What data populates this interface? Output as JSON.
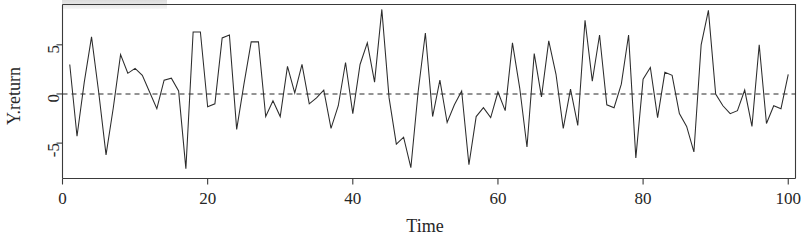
{
  "chart_data": {
    "type": "line",
    "title": "",
    "subtitle": "",
    "xlabel": "Time",
    "ylabel": "Y.return",
    "xlim": [
      0,
      101
    ],
    "ylim": [
      -8.6,
      9.1
    ],
    "grid": false,
    "legend": null,
    "xticks": [
      0,
      20,
      40,
      60,
      80,
      100
    ],
    "xtick_labels": [
      "0",
      "20",
      "40",
      "60",
      "80",
      "100"
    ],
    "yticks": [
      -5,
      0,
      5
    ],
    "ytick_labels": [
      "-5",
      "0",
      "5"
    ],
    "annotations": [
      {
        "kind": "horizontal-reference-line",
        "y": 0,
        "style": "dashed",
        "color": "#2b2b2b",
        "label": ""
      }
    ],
    "series": [
      {
        "name": "Y.return",
        "color": "#2c2c2c",
        "style": "solid",
        "x": [
          1,
          2,
          3,
          4,
          5,
          6,
          7,
          8,
          9,
          10,
          11,
          12,
          13,
          14,
          15,
          16,
          17,
          18,
          19,
          20,
          21,
          22,
          23,
          24,
          25,
          26,
          27,
          28,
          29,
          30,
          31,
          32,
          33,
          34,
          35,
          36,
          37,
          38,
          39,
          40,
          41,
          42,
          43,
          44,
          45,
          46,
          47,
          48,
          49,
          50,
          51,
          52,
          53,
          54,
          55,
          56,
          57,
          58,
          59,
          60,
          61,
          62,
          63,
          64,
          65,
          66,
          67,
          68,
          69,
          70,
          71,
          72,
          73,
          74,
          75,
          76,
          77,
          78,
          79,
          80,
          81,
          82,
          83,
          84,
          85,
          86,
          87,
          88,
          89,
          90,
          91,
          92,
          93,
          94,
          95,
          96,
          97,
          98,
          99,
          100
        ],
        "values": [
          3.0,
          -4.3,
          1.2,
          5.8,
          0.1,
          -6.2,
          -1.4,
          4.0,
          2.1,
          2.6,
          1.9,
          0.2,
          -1.5,
          1.4,
          1.6,
          0.3,
          -7.6,
          6.3,
          6.3,
          -1.3,
          -1.0,
          5.7,
          6.0,
          -3.6,
          1.0,
          5.3,
          5.3,
          -2.3,
          -0.7,
          -2.3,
          2.8,
          0.1,
          3.0,
          -1.0,
          -0.4,
          0.4,
          -3.5,
          -1.2,
          3.2,
          -2.0,
          3.0,
          5.2,
          1.2,
          8.6,
          -0.4,
          -5.1,
          -4.4,
          -7.5,
          0.2,
          6.2,
          -2.3,
          1.4,
          -2.9,
          -1.1,
          0.3,
          -7.2,
          -2.3,
          -1.4,
          -2.4,
          0.2,
          -1.7,
          5.2,
          0.6,
          -5.4,
          4.1,
          -0.3,
          5.4,
          2.0,
          -3.5,
          0.5,
          -3.2,
          7.5,
          1.3,
          6.0,
          -1.1,
          -1.4,
          1.0,
          6.0,
          -6.5,
          1.5,
          2.7,
          -2.4,
          2.2,
          1.9,
          -2.0,
          -3.3,
          -5.9,
          5.0,
          8.5,
          0.0,
          -1.2,
          -2.0,
          -1.7,
          0.4,
          -3.3,
          5.0,
          -3.0,
          -1.2,
          -1.5,
          2.0
        ]
      }
    ]
  }
}
